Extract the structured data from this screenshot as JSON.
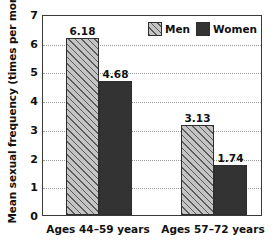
{
  "chart_data": {
    "type": "bar",
    "title": "",
    "xlabel": "",
    "ylabel": "Mean sexual frequency (times per month)",
    "ylim": [
      0,
      7
    ],
    "yticks": [
      "0",
      "1",
      "2",
      "3",
      "4",
      "5",
      "6",
      "7"
    ],
    "grid": true,
    "legend_position": "top-right",
    "categories": [
      "Ages 44–59 years",
      "Ages 57–72 years"
    ],
    "series": [
      {
        "name": "Men",
        "values": [
          6.18,
          4.68
        ],
        "labels": [
          "6.18",
          "3.13"
        ],
        "swatch": "hatched"
      },
      {
        "name": "Women",
        "values": [
          4.68,
          1.74
        ],
        "labels": [
          "4.68",
          "1.74"
        ],
        "swatch": "solid"
      }
    ],
    "bars": [
      {
        "group": 0,
        "series": "Men",
        "value": 6.18,
        "label": "6.18"
      },
      {
        "group": 0,
        "series": "Women",
        "value": 4.68,
        "label": "4.68"
      },
      {
        "group": 1,
        "series": "Men",
        "value": 3.13,
        "label": "3.13"
      },
      {
        "group": 1,
        "series": "Women",
        "value": 1.74,
        "label": "1.74"
      }
    ],
    "colors": {
      "men_fill": "#b7b7b7",
      "men_hatch": "#5c5c5c",
      "women_fill": "#333333",
      "bar_border": "#2e2e2e",
      "gridline": "#9a9a9a",
      "axis": "#3a3a3a",
      "text": "#111111",
      "background": "#ffffff"
    }
  },
  "legend": {
    "entries": [
      {
        "label": "Men"
      },
      {
        "label": "Women"
      }
    ]
  }
}
